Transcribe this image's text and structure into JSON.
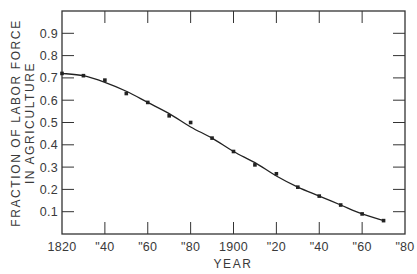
{
  "chart_data": {
    "type": "line",
    "title": "",
    "xlabel": "YEAR",
    "ylabel": [
      "FRACTION OF LABOR FORCE",
      "IN AGRICULTURE"
    ],
    "xlim": [
      1820,
      1980
    ],
    "ylim": [
      0,
      1.0
    ],
    "x_ticks": [
      1820,
      1840,
      1860,
      1880,
      1900,
      1920,
      1940,
      1960,
      1980
    ],
    "x_tick_labels": [
      "1820",
      "\"40",
      "\"60",
      "\"80",
      "1900",
      "\"20",
      "\"40",
      "\"60",
      "\"80"
    ],
    "y_ticks": [
      0.1,
      0.2,
      0.3,
      0.4,
      0.5,
      0.6,
      0.7,
      0.8,
      0.9
    ],
    "y_tick_labels": [
      "0.1",
      "0.2",
      "0.3",
      "0.4",
      "0.5",
      "0.6",
      "0.7",
      "0.8",
      "0.9"
    ],
    "grid": false,
    "legend": null,
    "series": [
      {
        "name": "Observed",
        "style": "points",
        "x": [
          1820,
          1830,
          1840,
          1850,
          1860,
          1870,
          1880,
          1890,
          1900,
          1910,
          1920,
          1930,
          1940,
          1950,
          1960,
          1970
        ],
        "values": [
          0.72,
          0.71,
          0.69,
          0.63,
          0.59,
          0.53,
          0.5,
          0.43,
          0.37,
          0.31,
          0.27,
          0.21,
          0.17,
          0.13,
          0.09,
          0.06
        ]
      },
      {
        "name": "Fitted curve",
        "style": "line",
        "x": [
          1820,
          1830,
          1840,
          1850,
          1860,
          1870,
          1880,
          1890,
          1900,
          1910,
          1920,
          1930,
          1940,
          1950,
          1960,
          1970
        ],
        "values": [
          0.72,
          0.71,
          0.68,
          0.64,
          0.59,
          0.54,
          0.48,
          0.43,
          0.37,
          0.32,
          0.26,
          0.21,
          0.17,
          0.13,
          0.09,
          0.06
        ]
      }
    ]
  },
  "layout": {
    "plot": {
      "left": 62,
      "right": 405,
      "top": 11,
      "bottom": 234
    },
    "colors": {
      "line": "#222222",
      "axis": "#333333",
      "text": "#3a3a3a",
      "background": "#ffffff"
    }
  }
}
